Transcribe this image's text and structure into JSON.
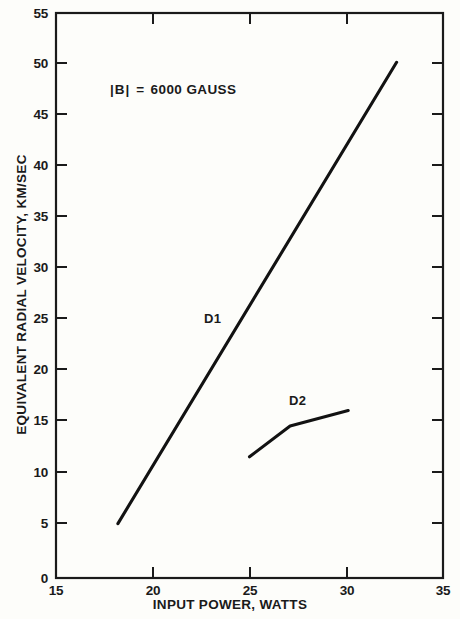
{
  "chart_data": {
    "type": "line",
    "title": "",
    "xlabel": "INPUT POWER, WATTS",
    "ylabel": "EQUIVALENT RADIAL VELOCITY, KM/SEC",
    "xlim": [
      15,
      35
    ],
    "ylim": [
      0,
      55
    ],
    "xticks": [
      15,
      20,
      25,
      30,
      35
    ],
    "yticks": [
      0,
      5,
      10,
      15,
      20,
      25,
      30,
      35,
      40,
      45,
      50,
      55
    ],
    "xtick_labels": [
      "15",
      "20",
      "25",
      "30",
      "35"
    ],
    "ytick_labels": [
      "0",
      "5",
      "10",
      "15",
      "20",
      "25",
      "30",
      "35",
      "40",
      "45",
      "50",
      "55"
    ],
    "grid": false,
    "legend_position": "inline-labels",
    "annotations": [
      {
        "name": "magnetic-field-annotation",
        "text": "|B|  =  6000 GAUSS",
        "parts": {
          "symbol": "|B|",
          "equals": "=",
          "value": "6000 GAUSS"
        },
        "x": 17.8,
        "y": 46.5
      }
    ],
    "series": [
      {
        "name": "D1",
        "label": "D1",
        "label_x": 23.1,
        "label_y": 26.0,
        "x": [
          18.2,
          32.6
        ],
        "y": [
          5.3,
          50.2
        ]
      },
      {
        "name": "D2",
        "label": "D2",
        "label_x": 27.0,
        "label_y": 17.8,
        "x": [
          25.0,
          27.1,
          30.1
        ],
        "y": [
          11.8,
          14.8,
          16.3
        ]
      }
    ],
    "colors": {
      "line": "#121212",
      "axis": "#1a1a1a",
      "text": "#1a1a1a",
      "background": "#fdfdfa"
    }
  }
}
